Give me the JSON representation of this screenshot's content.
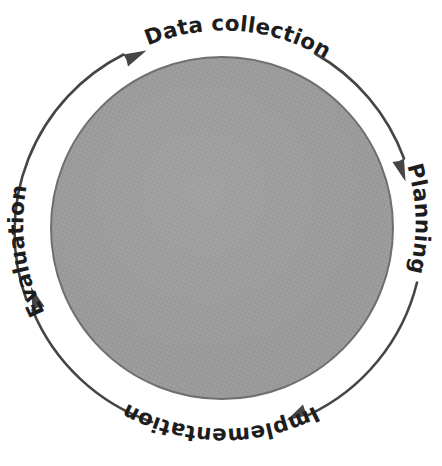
{
  "diagram": {
    "type": "cyclical-process-diagram",
    "title": "",
    "flow_direction": "clockwise",
    "background_color": "#ffffff",
    "center_shape": {
      "name": "center-circle",
      "shape": "circle",
      "fill_color": "#9a9a9a",
      "edge_color": "#6f6f6f",
      "texture": "halftone",
      "cx": 222,
      "cy": 228,
      "r": 171
    },
    "arc_color": "#454545",
    "label_color": "#1d1d1d",
    "stages": [
      {
        "id": "data-collection",
        "label": "Data collection",
        "position": "top",
        "order": 1,
        "text_start_angle": -132,
        "text_end_angle": -40,
        "inverted": false
      },
      {
        "id": "planning",
        "label": "Planning",
        "position": "right",
        "order": 2,
        "text_start_angle": -28,
        "text_end_angle": 52,
        "inverted": false
      },
      {
        "id": "implementation",
        "label": "Implementation",
        "position": "bottom",
        "order": 3,
        "text_start_angle": 62,
        "text_end_angle": 140,
        "inverted": true
      },
      {
        "id": "evaluation",
        "label": "Evaluation",
        "position": "left",
        "order": 4,
        "text_start_angle": 150,
        "text_end_angle": 215,
        "inverted": true
      }
    ],
    "arrows": [
      {
        "id": "arrow-to-data-collection",
        "from_stage": "evaluation",
        "to_stage": "data-collection",
        "points_to": "top-left",
        "direction": "clockwise"
      },
      {
        "id": "arrow-to-planning",
        "from_stage": "data-collection",
        "to_stage": "planning",
        "points_to": "right-upper",
        "direction": "clockwise"
      },
      {
        "id": "arrow-to-implementation",
        "from_stage": "planning",
        "to_stage": "implementation",
        "points_to": "bottom-right",
        "direction": "clockwise"
      },
      {
        "id": "arrow-to-evaluation",
        "from_stage": "implementation",
        "to_stage": "evaluation",
        "points_to": "left-lower",
        "direction": "clockwise"
      }
    ]
  }
}
